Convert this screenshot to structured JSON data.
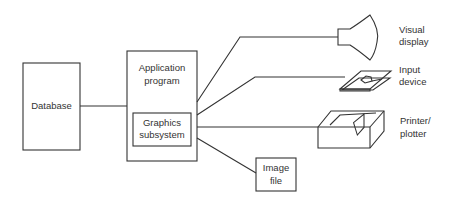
{
  "nodes": {
    "database": {
      "label": "Database"
    },
    "application": {
      "label_line1": "Application",
      "label_line2": "program"
    },
    "graphics": {
      "label_line1": "Graphics",
      "label_line2": "subsystem"
    },
    "image_file": {
      "label_line1": "Image",
      "label_line2": "file"
    },
    "visual_display": {
      "label_line1": "Visual",
      "label_line2": "display"
    },
    "input_device": {
      "label_line1": "Input",
      "label_line2": "device"
    },
    "printer": {
      "label_line1": "Printer/",
      "label_line2": "plotter"
    }
  },
  "colors": {
    "stroke": "#333333",
    "background": "#ffffff"
  }
}
